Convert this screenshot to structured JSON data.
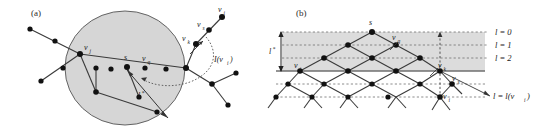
{
  "figure": {
    "panels": [
      {
        "id": "a",
        "label": "(a)",
        "labels": {
          "v_j": "v",
          "v_j_sub": "j",
          "s": "s",
          "v_q": "v",
          "v_q_sub": "q",
          "v_k": "v",
          "v_k_sub": "k",
          "v_s": "v",
          "v_s_sub": "s",
          "v_i": "v",
          "v_i_sub": "i",
          "I_v_i": "I(v",
          "I_v_i_sub": "i",
          "I_v_i_close": ")",
          "l_star": "l",
          "l_star_sup": "*"
        },
        "colors": {
          "disk_fill": "#d6d6d6",
          "disk_stroke": "#555555",
          "node_fill": "#111111",
          "edge_stroke": "#3a3a3a",
          "dash_stroke": "#555555"
        }
      },
      {
        "id": "b",
        "label": "(b)",
        "labels": {
          "s": "s",
          "v_q": "v",
          "v_q_sub": "q",
          "v_j": "v",
          "v_j_sub": "j",
          "v_k": "v",
          "v_k_sub": "k",
          "v_s": "v",
          "v_s_sub": "s",
          "v_i": "v",
          "v_i_sub": "i",
          "l_star": "l",
          "l_star_sup": "*"
        },
        "levels": [
          {
            "label": "l = 0",
            "value": 0
          },
          {
            "label": "l = 1",
            "value": 1
          },
          {
            "label": "l = 2",
            "value": 2
          }
        ],
        "bottom_label": {
          "prefix": "l = l(v",
          "sub": "i",
          "suffix": ")"
        },
        "colors": {
          "band_fill": "#dcdcdc",
          "band_line": "#6f6f6f",
          "grid_stroke": "#707070",
          "node_fill": "#111111",
          "edge_stroke": "#3a3a3a"
        }
      }
    ]
  }
}
